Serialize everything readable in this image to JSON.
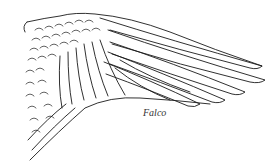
{
  "figure": {
    "caption": "Falco",
    "colors": {
      "line": "#1a1a1a",
      "background": "#ffffff"
    }
  }
}
